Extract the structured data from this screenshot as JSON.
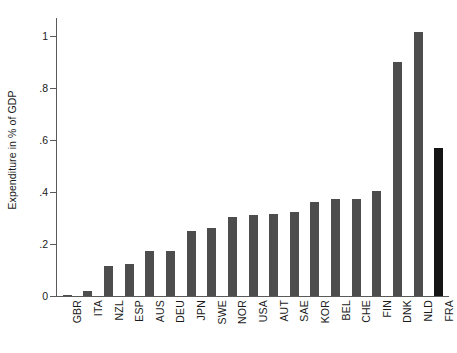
{
  "chart_data": {
    "type": "bar",
    "title": "",
    "subtitle": "",
    "xlabel": "",
    "ylabel": "Expenditure in % of GDP",
    "categories": [
      "GBR",
      "ITA",
      "NZL",
      "ESP",
      "AUS",
      "DEU",
      "JPN",
      "SWE",
      "NOR",
      "USA",
      "AUT",
      "SAE",
      "KOR",
      "BEL",
      "CHE",
      "FIN",
      "DNK",
      "NLD",
      "FRA"
    ],
    "values": [
      0.005,
      0.02,
      0.115,
      0.125,
      0.175,
      0.175,
      0.25,
      0.26,
      0.305,
      0.31,
      0.315,
      0.325,
      0.36,
      0.375,
      0.375,
      0.405,
      0.9,
      1.015,
      0.57
    ],
    "ylim": [
      0,
      1.07
    ],
    "yticks": [
      0,
      0.2,
      0.4,
      0.6,
      0.8,
      1
    ],
    "ytick_labels": [
      "0",
      ".2",
      ".4",
      ".6",
      ".8",
      "1"
    ],
    "grid": false,
    "legend": null,
    "bar_color": "#4d4d4d",
    "highlight_color": "#151515",
    "highlight_categories": [
      "FRA"
    ],
    "axis_color": "#5a5a5a",
    "background": "#ffffff"
  }
}
